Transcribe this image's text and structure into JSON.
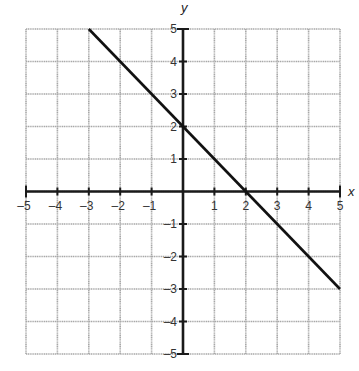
{
  "chart_data": {
    "type": "line",
    "title": "",
    "xlabel": "x",
    "ylabel": "y",
    "xlim": [
      -5,
      5
    ],
    "ylim": [
      -5,
      5
    ],
    "grid": true,
    "x_ticks": [
      -5,
      -4,
      -3,
      -2,
      -1,
      1,
      2,
      3,
      4,
      5
    ],
    "y_ticks": [
      -5,
      -4,
      -3,
      -2,
      -1,
      1,
      2,
      3,
      4,
      5
    ],
    "x_tick_labels": [
      "–5",
      "–4",
      "–3",
      "–2",
      "–1",
      "1",
      "2",
      "3",
      "4",
      "5"
    ],
    "y_tick_labels": [
      "–5",
      "–4",
      "–3",
      "–2",
      "–1",
      "1",
      "2",
      "3",
      "4",
      "5"
    ],
    "series": [
      {
        "name": "line",
        "equation": "y = -x + 2",
        "x": [
          -3,
          5
        ],
        "y": [
          5,
          -3
        ]
      }
    ],
    "legend": null
  },
  "colors": {
    "grid": "#a8a8a8",
    "axis": "#1a1a1a",
    "line": "#111111"
  },
  "layout": {
    "left": 26,
    "right": 340,
    "top": 29,
    "bottom": 354
  }
}
